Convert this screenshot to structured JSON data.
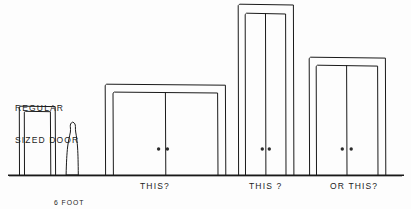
{
  "drawing": {
    "title": "Door Size Comparison Sketch",
    "medium": "hand-drawn ink line drawing",
    "ink_color": "#1a1a1a",
    "background_color": "#fdfdfd",
    "ground_line_y": 175
  },
  "labels": {
    "regular_door": "REGULAR\nSIZED DOOR",
    "regular_door_line1": "REGULAR",
    "regular_door_line2": "SIZED DOOR",
    "six_foot_man": "6 FOOT\nMAN",
    "six_foot_man_line1": "6 FOOT",
    "six_foot_man_line2": "MAN",
    "door_a": "THIS?",
    "door_b": "THIS ?",
    "door_c": "OR THIS?"
  },
  "figures": {
    "man": {
      "name": "6 FOOT MAN",
      "height_label": "6 FOOT",
      "x": 72,
      "base_y": 175,
      "top_y": 122
    }
  },
  "doors": [
    {
      "id": "regular-door",
      "label": "REGULAR SIZED DOOR",
      "caption": "",
      "type": "single",
      "panels": 1,
      "has_handles": false,
      "frame": {
        "x": 19,
        "y": 106,
        "width": 37,
        "height": 69
      },
      "panel": {
        "x": 24,
        "y": 111,
        "width": 27,
        "height": 64
      }
    },
    {
      "id": "door-a",
      "label": "THIS?",
      "caption": "THIS?",
      "type": "double",
      "panels": 2,
      "has_handles": true,
      "frame": {
        "x": 105,
        "y": 84,
        "width": 121,
        "height": 91
      },
      "panel": {
        "x": 113,
        "y": 92,
        "width": 105,
        "height": 83
      }
    },
    {
      "id": "door-b",
      "label": "THIS ?",
      "caption": "THIS ?",
      "type": "double",
      "panels": 2,
      "has_handles": true,
      "frame": {
        "x": 238,
        "y": 4,
        "width": 56,
        "height": 171
      },
      "panel": {
        "x": 245,
        "y": 13,
        "width": 41,
        "height": 162
      }
    },
    {
      "id": "door-c",
      "label": "OR THIS?",
      "caption": "OR THIS?",
      "type": "double",
      "panels": 2,
      "has_handles": true,
      "frame": {
        "x": 309,
        "y": 57,
        "width": 77,
        "height": 118
      },
      "panel": {
        "x": 316,
        "y": 65,
        "width": 62,
        "height": 110
      }
    }
  ],
  "handles": {
    "door_a": {
      "left_x": 158,
      "right_x": 167,
      "y": 149,
      "radius": 1.6
    },
    "door_b": {
      "left_x": 262,
      "right_x": 269,
      "y": 149,
      "radius": 1.6
    },
    "door_c": {
      "left_x": 342,
      "right_x": 351,
      "y": 149,
      "radius": 1.6
    }
  },
  "ground": {
    "x_start": 8,
    "x_end": 404,
    "y": 175
  }
}
